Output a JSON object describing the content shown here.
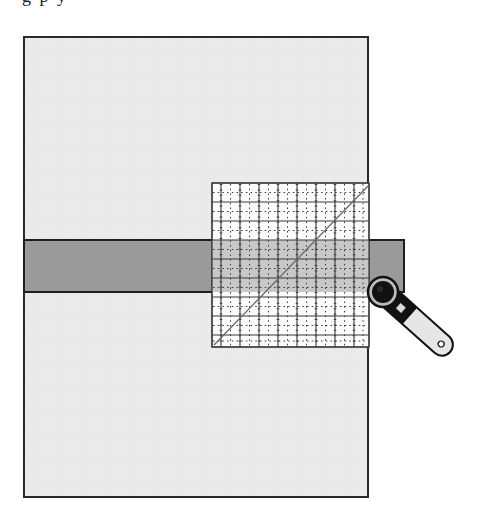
{
  "caption": {
    "text": "g     p  y"
  },
  "diagram": {
    "colors": {
      "fabric": "#ebebeb",
      "fabric_border": "#2a2a2a",
      "strip": "#9a9a9a",
      "ruler_fill": "#ffffff",
      "ruler_grid": "#3a3a3a",
      "ruler_overlap": "#c6c6c6",
      "cutter_handle": "#e6e6e6",
      "cutter_dark": "#111111"
    },
    "fabric": {
      "x": 24,
      "y": 37,
      "width": 344,
      "height": 460
    },
    "strip": {
      "x": 24,
      "y": 240,
      "width": 380,
      "height": 52
    },
    "ruler": {
      "x": 212,
      "y": 183,
      "width": 157,
      "height": 164,
      "cell": 19
    },
    "cutter": {
      "blade_cx": 383,
      "blade_cy": 292,
      "handle_end_x": 449,
      "handle_end_y": 351
    }
  }
}
